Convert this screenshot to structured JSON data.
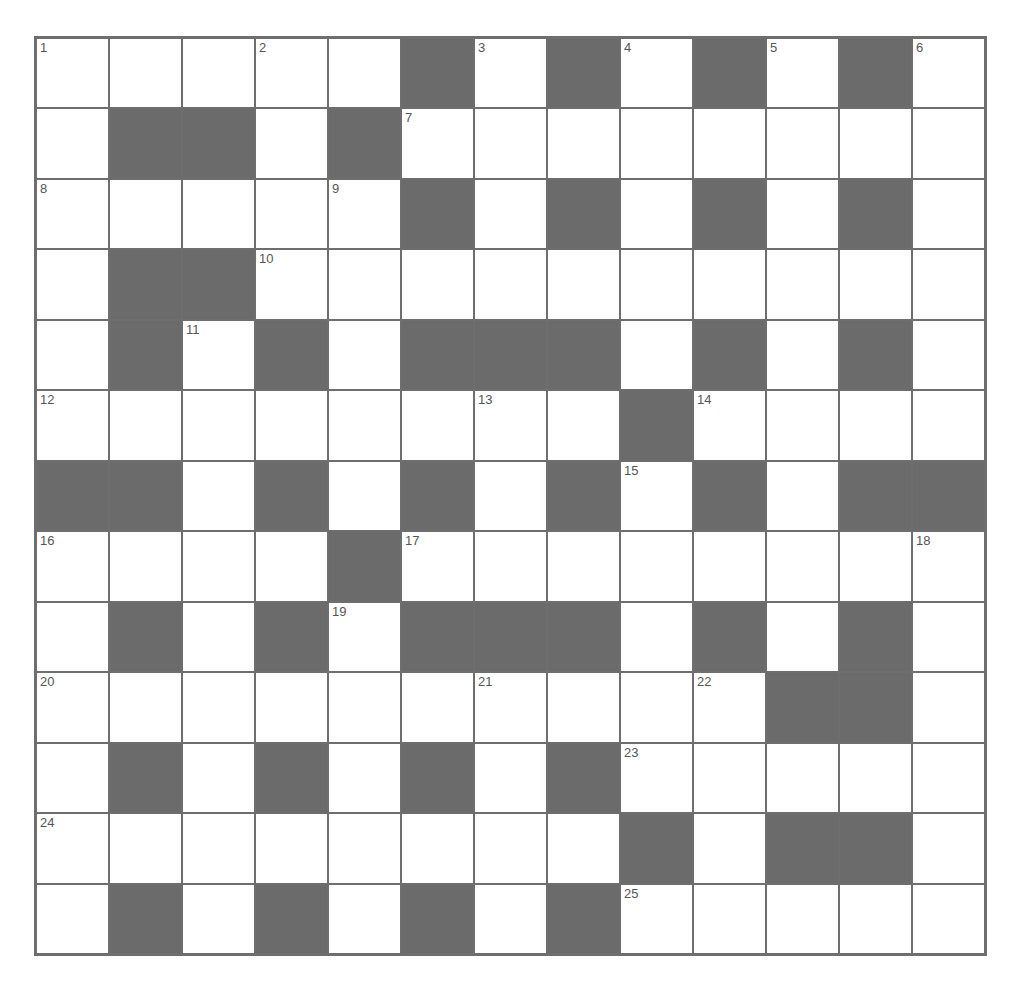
{
  "puzzle": {
    "rows": 13,
    "cols": 13,
    "colors": {
      "block": "#6b6b6b",
      "cell": "#ffffff",
      "line": "#6e6e6e",
      "number": "#555555"
    },
    "grid": [
      "WWWWWBWBWBWBW",
      "WBBWBWWWWWWWW",
      "WWWWWBWBWBWBW",
      "WBBWWWWWWWWWW",
      "WBWBWBBBWBWBW",
      "WWWWWWWWBWWWW",
      "BBWBWBWBWBWBB",
      "WWWWBWWWWWWWW",
      "WBWBWBBBWBWBW",
      "WWWWWWWWWWBBW",
      "WBWBWBWBWWWWW",
      "WWWWWWWWBWBBW",
      "WBWBWBWBWWWWW"
    ],
    "numbers": [
      {
        "r": 0,
        "c": 0,
        "n": "1"
      },
      {
        "r": 0,
        "c": 3,
        "n": "2"
      },
      {
        "r": 0,
        "c": 6,
        "n": "3"
      },
      {
        "r": 0,
        "c": 8,
        "n": "4"
      },
      {
        "r": 0,
        "c": 10,
        "n": "5"
      },
      {
        "r": 0,
        "c": 12,
        "n": "6"
      },
      {
        "r": 1,
        "c": 5,
        "n": "7"
      },
      {
        "r": 2,
        "c": 0,
        "n": "8"
      },
      {
        "r": 2,
        "c": 4,
        "n": "9"
      },
      {
        "r": 3,
        "c": 3,
        "n": "10"
      },
      {
        "r": 4,
        "c": 2,
        "n": "11"
      },
      {
        "r": 5,
        "c": 0,
        "n": "12"
      },
      {
        "r": 5,
        "c": 6,
        "n": "13"
      },
      {
        "r": 5,
        "c": 9,
        "n": "14"
      },
      {
        "r": 6,
        "c": 8,
        "n": "15"
      },
      {
        "r": 7,
        "c": 0,
        "n": "16"
      },
      {
        "r": 7,
        "c": 5,
        "n": "17"
      },
      {
        "r": 7,
        "c": 12,
        "n": "18"
      },
      {
        "r": 8,
        "c": 4,
        "n": "19"
      },
      {
        "r": 9,
        "c": 0,
        "n": "20"
      },
      {
        "r": 9,
        "c": 6,
        "n": "21"
      },
      {
        "r": 9,
        "c": 9,
        "n": "22"
      },
      {
        "r": 10,
        "c": 8,
        "n": "23"
      },
      {
        "r": 11,
        "c": 0,
        "n": "24"
      },
      {
        "r": 12,
        "c": 8,
        "n": "25"
      }
    ]
  }
}
